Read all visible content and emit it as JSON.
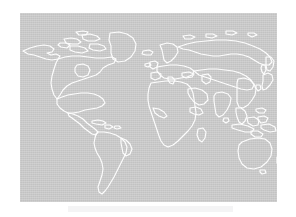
{
  "page": {
    "background_color": "#ffffff",
    "width": 296,
    "height": 217
  },
  "figure": {
    "name": "world-map",
    "kind": "image",
    "alt": "World map outline",
    "frame": {
      "x": 20,
      "y": 13,
      "width": 257,
      "height": 189
    },
    "colors": {
      "land_ocean_fill": "#c2c2c2",
      "coastline_stroke": "#fdfdfd",
      "page_background": "#ffffff",
      "caption_band": "#f4f4f5"
    },
    "projection_note": "",
    "has_graticule": false,
    "has_labels": false,
    "includes_antarctica": false,
    "regions": [
      "North America",
      "Greenland",
      "Canadian Arctic Archipelago",
      "Alaska",
      "Central America",
      "Caribbean",
      "South America",
      "Europe",
      "Scandinavia",
      "Iceland",
      "British Isles",
      "Mediterranean",
      "Africa",
      "Madagascar",
      "Arabian Peninsula",
      "Asia",
      "Siberia",
      "India",
      "China",
      "Japan",
      "Kamchatka",
      "Southeast Asia",
      "Indonesia",
      "Philippines",
      "New Guinea",
      "Australia",
      "New Zealand"
    ]
  },
  "caption": {
    "text": ""
  }
}
